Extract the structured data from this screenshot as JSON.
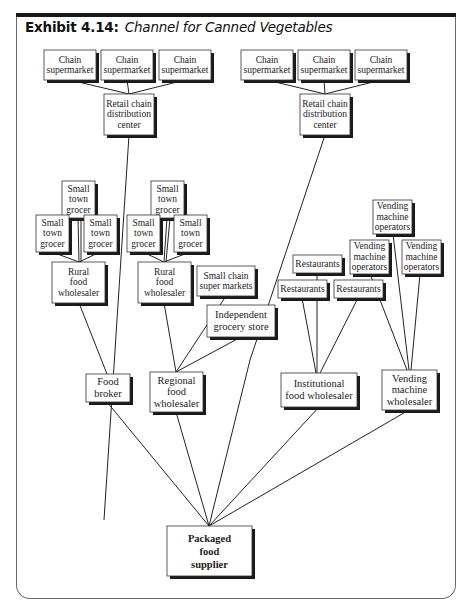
{
  "exhibit": {
    "label": "Exhibit 4.14:",
    "title": "Channel for Canned Vegetables"
  },
  "nodes": [
    {
      "id": "cs1",
      "lines": [
        "Chain",
        "supermarket"
      ],
      "x": 44,
      "y": 50,
      "w": 52,
      "h": 30
    },
    {
      "id": "cs2",
      "lines": [
        "Chain",
        "supermarket"
      ],
      "x": 101,
      "y": 50,
      "w": 52,
      "h": 30
    },
    {
      "id": "cs3",
      "lines": [
        "Chain",
        "supermarket"
      ],
      "x": 159,
      "y": 50,
      "w": 52,
      "h": 30
    },
    {
      "id": "rcdc1",
      "lines": [
        "Retail chain",
        "distribution",
        "center"
      ],
      "x": 104,
      "y": 94,
      "w": 50,
      "h": 41
    },
    {
      "id": "cs4",
      "lines": [
        "Chain",
        "supermarket"
      ],
      "x": 241,
      "y": 50,
      "w": 52,
      "h": 30
    },
    {
      "id": "cs5",
      "lines": [
        "Chain",
        "supermarket"
      ],
      "x": 298,
      "y": 50,
      "w": 52,
      "h": 30
    },
    {
      "id": "cs6",
      "lines": [
        "Chain",
        "supermarket"
      ],
      "x": 355,
      "y": 50,
      "w": 52,
      "h": 30
    },
    {
      "id": "rcdc2",
      "lines": [
        "Retail chain",
        "distribution",
        "center"
      ],
      "x": 300,
      "y": 94,
      "w": 50,
      "h": 41
    },
    {
      "id": "stg1",
      "lines": [
        "Small",
        "town",
        "grocer"
      ],
      "x": 62,
      "y": 181,
      "w": 33,
      "h": 37
    },
    {
      "id": "stg2",
      "lines": [
        "Small",
        "town",
        "grocer"
      ],
      "x": 36,
      "y": 215,
      "w": 33,
      "h": 37
    },
    {
      "id": "stg3",
      "lines": [
        "Small",
        "town",
        "grocer"
      ],
      "x": 84,
      "y": 215,
      "w": 33,
      "h": 37
    },
    {
      "id": "rfw1",
      "lines": [
        "Rural",
        "food",
        "wholesaler"
      ],
      "x": 52,
      "y": 262,
      "w": 53,
      "h": 41
    },
    {
      "id": "stg4",
      "lines": [
        "Small",
        "town",
        "grocer"
      ],
      "x": 151,
      "y": 181,
      "w": 33,
      "h": 37
    },
    {
      "id": "stg5",
      "lines": [
        "Small",
        "town",
        "grocer"
      ],
      "x": 127,
      "y": 215,
      "w": 33,
      "h": 37
    },
    {
      "id": "stg6",
      "lines": [
        "Small",
        "town",
        "grocer"
      ],
      "x": 174,
      "y": 215,
      "w": 33,
      "h": 37
    },
    {
      "id": "rfw2",
      "lines": [
        "Rural",
        "food",
        "wholesaler"
      ],
      "x": 138,
      "y": 262,
      "w": 53,
      "h": 41
    },
    {
      "id": "scsm",
      "lines": [
        "Small chain",
        "super markets"
      ],
      "x": 197,
      "y": 266,
      "w": 58,
      "h": 30
    },
    {
      "id": "igs",
      "lines": [
        "Independent",
        "grocery store"
      ],
      "x": 207,
      "y": 305,
      "w": 68,
      "h": 32,
      "big": true
    },
    {
      "id": "rest1",
      "lines": [
        "Restaurants"
      ],
      "x": 293,
      "y": 255,
      "w": 49,
      "h": 18
    },
    {
      "id": "rest2",
      "lines": [
        "Restaurants"
      ],
      "x": 278,
      "y": 280,
      "w": 49,
      "h": 18
    },
    {
      "id": "rest3",
      "lines": [
        "Restaurants"
      ],
      "x": 334,
      "y": 280,
      "w": 49,
      "h": 18
    },
    {
      "id": "vmo1",
      "lines": [
        "Vending",
        "machine",
        "operators"
      ],
      "x": 373,
      "y": 200,
      "w": 39,
      "h": 34
    },
    {
      "id": "vmo2",
      "lines": [
        "Vending",
        "machine",
        "operators"
      ],
      "x": 350,
      "y": 240,
      "w": 39,
      "h": 34
    },
    {
      "id": "vmo3",
      "lines": [
        "Vending",
        "machine",
        "operators"
      ],
      "x": 402,
      "y": 240,
      "w": 39,
      "h": 34
    },
    {
      "id": "fb",
      "lines": [
        "Food",
        "broker"
      ],
      "x": 86,
      "y": 374,
      "w": 44,
      "h": 28,
      "big": true
    },
    {
      "id": "rgfw",
      "lines": [
        "Regional",
        "food",
        "wholesaler"
      ],
      "x": 150,
      "y": 372,
      "w": 53,
      "h": 40,
      "big": true
    },
    {
      "id": "ifw",
      "lines": [
        "Institutional",
        "food wholesaler"
      ],
      "x": 281,
      "y": 373,
      "w": 76,
      "h": 34,
      "big": true
    },
    {
      "id": "vmw",
      "lines": [
        "Vending",
        "machine",
        "wholesaler"
      ],
      "x": 382,
      "y": 370,
      "w": 55,
      "h": 40,
      "big": true
    },
    {
      "id": "pfs",
      "lines": [
        "Packaged",
        "food",
        "supplier"
      ],
      "x": 167,
      "y": 526,
      "w": 85,
      "h": 50,
      "bold": true
    }
  ],
  "edges": [
    [
      [
        70,
        80
      ],
      [
        129,
        94
      ]
    ],
    [
      [
        127,
        80
      ],
      [
        129,
        94
      ]
    ],
    [
      [
        185,
        80
      ],
      [
        129,
        94
      ]
    ],
    [
      [
        267,
        80
      ],
      [
        325,
        94
      ]
    ],
    [
      [
        324,
        80
      ],
      [
        325,
        94
      ]
    ],
    [
      [
        381,
        80
      ],
      [
        325,
        94
      ]
    ],
    [
      [
        129,
        135
      ],
      [
        104,
        520
      ]
    ],
    [
      [
        325,
        135
      ],
      [
        250,
        360
      ]
    ],
    [
      [
        78,
        218
      ],
      [
        79,
        262
      ]
    ],
    [
      [
        52,
        252
      ],
      [
        79,
        262
      ]
    ],
    [
      [
        100,
        252
      ],
      [
        79,
        262
      ]
    ],
    [
      [
        81,
        218
      ],
      [
        81,
        262
      ]
    ],
    [
      [
        167,
        218
      ],
      [
        164,
        262
      ]
    ],
    [
      [
        143,
        252
      ],
      [
        164,
        262
      ]
    ],
    [
      [
        190,
        252
      ],
      [
        164,
        262
      ]
    ],
    [
      [
        170,
        218
      ],
      [
        166,
        262
      ]
    ],
    [
      [
        79,
        303
      ],
      [
        107,
        374
      ]
    ],
    [
      [
        164,
        303
      ],
      [
        176,
        372
      ]
    ],
    [
      [
        226,
        296
      ],
      [
        176,
        372
      ]
    ],
    [
      [
        241,
        337
      ],
      [
        176,
        372
      ]
    ],
    [
      [
        317,
        273
      ],
      [
        317,
        373
      ]
    ],
    [
      [
        302,
        298
      ],
      [
        316,
        373
      ]
    ],
    [
      [
        358,
        298
      ],
      [
        320,
        373
      ]
    ],
    [
      [
        393,
        234
      ],
      [
        409,
        370
      ]
    ],
    [
      [
        370,
        274
      ],
      [
        407,
        370
      ]
    ],
    [
      [
        420,
        274
      ],
      [
        411,
        370
      ]
    ],
    [
      [
        107,
        402
      ],
      [
        209,
        526
      ]
    ],
    [
      [
        176,
        412
      ],
      [
        209,
        526
      ]
    ],
    [
      [
        250,
        360
      ],
      [
        209,
        526
      ]
    ],
    [
      [
        319,
        407
      ],
      [
        209,
        526
      ]
    ],
    [
      [
        409,
        410
      ],
      [
        209,
        526
      ]
    ]
  ]
}
